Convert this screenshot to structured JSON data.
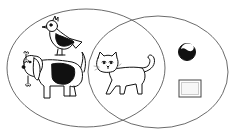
{
  "diagram": {
    "type": "venn",
    "sets": [
      {
        "id": "left",
        "members": [
          "bird",
          "dog"
        ]
      },
      {
        "id": "right",
        "members": [
          "ball",
          "rectangle-card"
        ]
      }
    ],
    "intersection": {
      "members": [
        "cat"
      ]
    },
    "colors": {
      "outline": "#555555",
      "ink": "#111111",
      "fill": "#ffffff"
    }
  }
}
